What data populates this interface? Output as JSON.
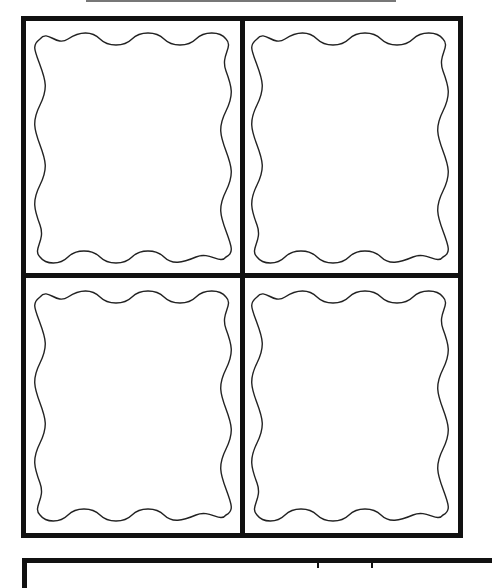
{
  "page": {
    "stroke_color": "#111111",
    "background": "#ffffff"
  },
  "grid": {
    "rows": 2,
    "cols": 2,
    "panels": [
      {
        "id": "top-left",
        "content": ""
      },
      {
        "id": "top-right",
        "content": ""
      },
      {
        "id": "bottom-left",
        "content": ""
      },
      {
        "id": "bottom-right",
        "content": ""
      }
    ]
  }
}
